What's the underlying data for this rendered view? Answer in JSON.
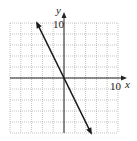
{
  "chart_data": {
    "type": "line",
    "title": "",
    "xlabel": "x",
    "ylabel": "y",
    "xlim": [
      -10,
      10
    ],
    "ylim": [
      -10,
      10
    ],
    "grid": true,
    "grid_step": 2,
    "tick_labels": {
      "x": "10",
      "y": "10"
    },
    "series": [
      {
        "name": "line",
        "x": [
          -5,
          5
        ],
        "y": [
          10,
          -10
        ],
        "slope": -2,
        "intercept": 0,
        "arrows": "both"
      }
    ]
  },
  "labels": {
    "x_axis": "x",
    "y_axis": "y",
    "x_tick": "10",
    "y_tick": "10"
  },
  "colors": {
    "grid": "#9a9a9a",
    "axis": "#222222",
    "line": "#1a1a1a"
  }
}
